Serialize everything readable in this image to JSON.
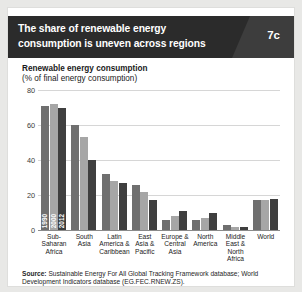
{
  "header": {
    "title": "The share of renewable energy consumption is uneven across regions",
    "badge": "7c",
    "bg_color": "#2b2b2b"
  },
  "chart_data": {
    "type": "bar",
    "title": "Renewable energy consumption",
    "subtitle": "(% of final energy consumption)",
    "xlabel": "",
    "ylabel": "",
    "ylim": [
      0,
      80
    ],
    "yticks": [
      "0",
      "20",
      "40",
      "60",
      "80"
    ],
    "grid": true,
    "legend": "in-bar vertical year labels",
    "categories": [
      "Sub-Saharan Africa",
      "South Asia",
      "Latin America & Caribbean",
      "East Asia & Pacific",
      "Europe & Central Asia",
      "North America",
      "Middle East & North Africa",
      "World"
    ],
    "category_lines": [
      [
        "Sub-",
        "Saharan",
        "Africa"
      ],
      [
        "South",
        "Asia"
      ],
      [
        "Latin",
        "America &",
        "Caribbean"
      ],
      [
        "East",
        "Asia &",
        "Pacific"
      ],
      [
        "Europe &",
        "Central",
        "Asia"
      ],
      [
        "North",
        "America"
      ],
      [
        "Middle",
        "East &",
        "North",
        "Africa"
      ],
      [
        "World"
      ]
    ],
    "series": [
      {
        "name": "1990",
        "color": "#6f6f6f",
        "values": [
          71,
          60,
          32,
          26,
          6,
          6,
          3,
          17
        ]
      },
      {
        "name": "2000",
        "color": "#a6a6a6",
        "values": [
          72,
          53,
          28,
          22,
          8,
          7,
          2,
          17
        ]
      },
      {
        "name": "2012",
        "color": "#3f3f3f",
        "values": [
          70,
          40,
          27,
          17,
          11,
          10,
          2,
          18
        ]
      }
    ]
  },
  "source": {
    "label": "Source:",
    "text": " Sustainable Energy For All Global Tracking Framework database; World Development Indicators database (EG.FEC.RNEW.ZS)."
  }
}
